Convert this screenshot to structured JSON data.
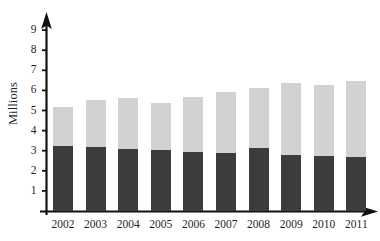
{
  "chart_data": {
    "type": "bar",
    "subtype": "stacked",
    "title": "",
    "subtitle": "",
    "xlabel": "",
    "ylabel": "Millions",
    "categories": [
      "2002",
      "2003",
      "2004",
      "2005",
      "2006",
      "2007",
      "2008",
      "2009",
      "2010",
      "2011"
    ],
    "series": [
      {
        "name": "lower-segment",
        "color": "#3c3c3c",
        "values": [
          3.25,
          3.2,
          3.1,
          3.05,
          2.95,
          2.9,
          3.15,
          2.8,
          2.75,
          2.7
        ]
      },
      {
        "name": "upper-segment",
        "color": "#d2d2d2",
        "values": [
          1.95,
          2.3,
          2.5,
          2.3,
          2.7,
          3.0,
          2.95,
          3.55,
          3.5,
          3.75
        ]
      }
    ],
    "totals": [
      5.2,
      5.5,
      5.6,
      5.35,
      5.65,
      5.9,
      6.1,
      6.35,
      6.25,
      6.45
    ],
    "ylim": [
      0,
      9.6
    ],
    "yticks": [
      "1",
      "2",
      "3",
      "4",
      "5",
      "6",
      "7",
      "8",
      "9"
    ],
    "ytick_values": [
      1,
      2,
      3,
      4,
      5,
      6,
      7,
      8,
      9
    ],
    "grid": false,
    "legend": "none",
    "axis_color": "#111111",
    "background_color": "#ffffff"
  },
  "axes": {
    "y_axis_title": "Millions",
    "y_axis_arrow": "arrow-up",
    "x_axis_arrow": "arrow-right"
  }
}
